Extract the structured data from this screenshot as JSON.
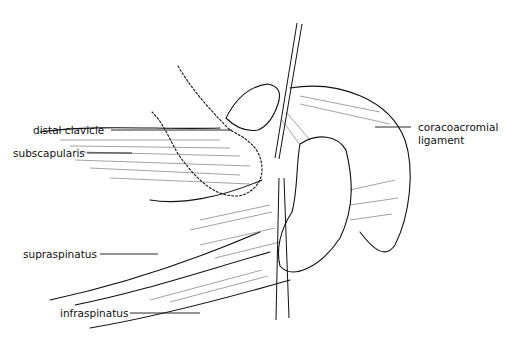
{
  "diagram": {
    "labels": [
      {
        "id": "distal-clavicle",
        "text": "distal clavicle"
      },
      {
        "id": "subscapularis",
        "text": "subscapularis"
      },
      {
        "id": "coracoacromial-ligament-line1",
        "text": "coracoacromial"
      },
      {
        "id": "coracoacromial-ligament-line2",
        "text": "ligament"
      },
      {
        "id": "supraspinatus",
        "text": "supraspinatus"
      },
      {
        "id": "infraspinatus",
        "text": "infraspinatus"
      }
    ]
  }
}
